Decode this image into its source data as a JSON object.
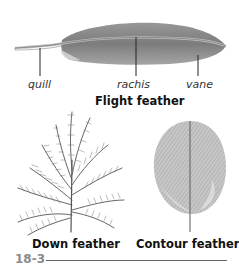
{
  "figure": {
    "number": "18-3",
    "flight_feather": {
      "title": "Flight feather",
      "labels": [
        {
          "text": "quill",
          "x": 40
        },
        {
          "text": "rachis",
          "x": 136
        },
        {
          "text": "vane",
          "x": 198
        }
      ]
    },
    "down_feather": {
      "title": "Down feather"
    },
    "contour_feather": {
      "title": "Contour feather"
    }
  },
  "colors": {
    "ink": "#333333",
    "feather_gray": "#8c8c8c",
    "figure_number": "#8a8a8a"
  }
}
